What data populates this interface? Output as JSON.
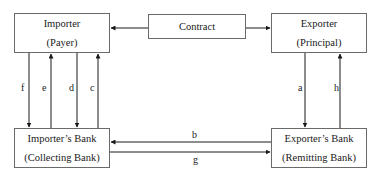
{
  "diagram": {
    "nodes": {
      "importer": {
        "title": "Importer",
        "role": "(Payer)"
      },
      "exporter": {
        "title": "Exporter",
        "role": "(Principal)"
      },
      "contract": {
        "title": "Contract"
      },
      "importers_bank": {
        "title": "Importer’s Bank",
        "role": "(Collecting Bank)"
      },
      "exporters_bank": {
        "title": "Exporter’s Bank",
        "role": "(Remitting Bank)"
      }
    },
    "flows": [
      {
        "label": "f",
        "from": "importer",
        "to": "importers_bank"
      },
      {
        "label": "e",
        "from": "importers_bank",
        "to": "importer"
      },
      {
        "label": "d",
        "from": "importer",
        "to": "importers_bank"
      },
      {
        "label": "c",
        "from": "importers_bank",
        "to": "importer"
      },
      {
        "label": "a",
        "from": "exporter",
        "to": "exporters_bank"
      },
      {
        "label": "h",
        "from": "exporters_bank",
        "to": "exporter"
      },
      {
        "label": "b",
        "from": "exporters_bank",
        "to": "importers_bank"
      },
      {
        "label": "g",
        "from": "importers_bank",
        "to": "exporters_bank"
      }
    ],
    "contract_links": [
      {
        "from": "contract",
        "to": "importer"
      },
      {
        "from": "contract",
        "to": "exporter"
      }
    ],
    "colors": {
      "line": "#1a1a1a",
      "border": "#6a6a6a"
    }
  }
}
